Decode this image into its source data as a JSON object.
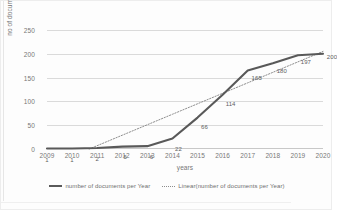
{
  "chart_data": {
    "type": "line",
    "title": "",
    "xlabel": "years",
    "ylabel": "no of documents",
    "categories": [
      "2009",
      "2010",
      "2011",
      "2012",
      "2013",
      "2014",
      "2015",
      "2016",
      "2017",
      "2018",
      "2019",
      "2020"
    ],
    "ylim": [
      0,
      250
    ],
    "yticks": [
      0,
      50,
      100,
      150,
      200,
      250
    ],
    "grid": true,
    "legend_position": "bottom",
    "series": [
      {
        "name": "number of documents per Year",
        "style": "solid",
        "color": "#5a5a5a",
        "values": [
          1,
          1,
          2,
          5,
          6,
          22,
          66,
          114,
          165,
          180,
          197,
          200
        ],
        "labels": [
          "1",
          "1",
          "2",
          "5",
          "6",
          "22",
          "66",
          "114",
          "165",
          "180",
          "197",
          "200"
        ]
      },
      {
        "name": "Linear(number of documents per Year)",
        "style": "dotted",
        "color": "#8d8d8d",
        "trendline": true,
        "values": [
          -37,
          -15,
          7,
          29,
          51,
          73,
          95,
          117,
          139,
          161,
          183,
          205
        ]
      }
    ]
  },
  "axis": {
    "y_title": "no of documents",
    "x_title": "years",
    "y_tick_labels": [
      "250",
      "200",
      "150",
      "100",
      "50",
      "0"
    ],
    "x_tick_labels": [
      "2009",
      "2010",
      "2011",
      "2012",
      "2013",
      "2014",
      "2015",
      "2016",
      "2017",
      "2018",
      "2019",
      "2020"
    ]
  },
  "legend": {
    "items": [
      {
        "label": "number of documents per Year",
        "marker": "solid-line-icon"
      },
      {
        "label": "Linear(number of documents per Year)",
        "marker": "dotted-line-icon"
      }
    ]
  }
}
